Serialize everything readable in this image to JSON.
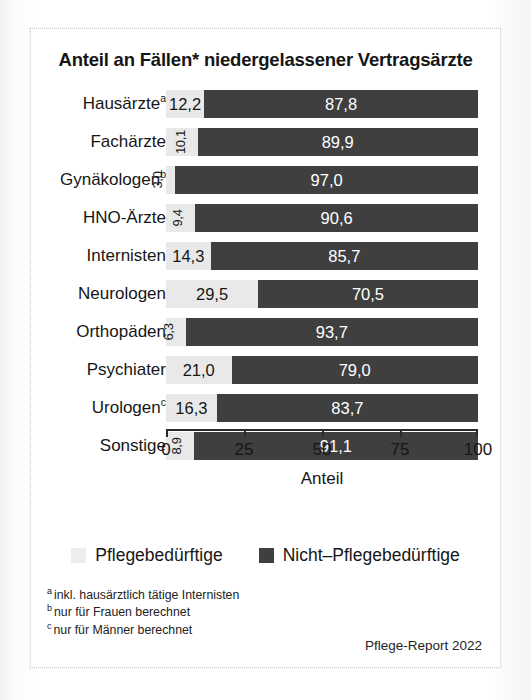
{
  "chart_data": {
    "type": "bar",
    "orientation": "horizontal",
    "stacked": true,
    "title": "Anteil an Fällen* niedergelassener Vertragsärzte",
    "xlabel": "Anteil",
    "ylabel": "",
    "xlim": [
      0,
      100
    ],
    "xticks": [
      "0",
      "25",
      "50",
      "75",
      "100"
    ],
    "xtick_values": [
      0,
      25,
      50,
      75,
      100
    ],
    "grid": false,
    "legend_position": "bottom",
    "categories": [
      "Hausärzte",
      "Fachärzte",
      "Gynäkologen",
      "HNO-Ärzte",
      "Internisten",
      "Neurologen",
      "Orthopäden",
      "Psychiater",
      "Urologen",
      "Sonstige"
    ],
    "category_markers": [
      "a",
      "",
      "b",
      "",
      "",
      "",
      "",
      "",
      "c",
      ""
    ],
    "series": [
      {
        "name": "Pflegebedürftige",
        "color": "#e9e9e9",
        "values": [
          12.2,
          10.1,
          3.0,
          9.4,
          14.3,
          29.5,
          6.3,
          21.0,
          16.3,
          8.9
        ],
        "labels": [
          "12,2",
          "10,1",
          "3,0",
          "9,4",
          "14,3",
          "29,5",
          "6,3",
          "21,0",
          "16,3",
          "8,9"
        ]
      },
      {
        "name": "Nicht–Pflegebedürftige",
        "color": "#3f3f3f",
        "values": [
          87.8,
          89.9,
          97.0,
          90.6,
          85.7,
          70.5,
          93.7,
          79.0,
          83.7,
          91.1
        ],
        "labels": [
          "87,8",
          "89,9",
          "97,0",
          "90,6",
          "85,7",
          "70,5",
          "93,7",
          "79,0",
          "83,7",
          "91,1"
        ]
      }
    ]
  },
  "legend": [
    {
      "label": "Pflegebedürftige",
      "swatch": "light"
    },
    {
      "label": "Nicht–Pflegebedürftige",
      "swatch": "dark"
    }
  ],
  "footnotes": [
    {
      "marker": "a",
      "text": "inkl. hausärztlich tätige Internisten"
    },
    {
      "marker": "b",
      "text": "nur für Frauen berechnet"
    },
    {
      "marker": "c",
      "text": "nur für Männer berechnet"
    }
  ],
  "source": "Pflege-Report 2022"
}
